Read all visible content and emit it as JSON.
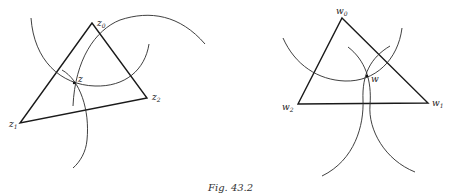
{
  "figure": {
    "caption": "Fig. 43.2",
    "left": {
      "labels": {
        "z0": {
          "base": "z",
          "sub": "0"
        },
        "z1": {
          "base": "z",
          "sub": "1"
        },
        "z2": {
          "base": "z",
          "sub": "2"
        },
        "z": {
          "base": "z"
        }
      },
      "vertices": {
        "z0": [
          92,
          23
        ],
        "z1": [
          20,
          123
        ],
        "z2": [
          147,
          98
        ]
      },
      "point": [
        74,
        83
      ]
    },
    "right": {
      "labels": {
        "w0": {
          "base": "w",
          "sub": "0"
        },
        "w1": {
          "base": "w",
          "sub": "1"
        },
        "w2": {
          "base": "w",
          "sub": "2"
        },
        "w": {
          "base": "w"
        }
      },
      "vertices": {
        "w0": [
          342,
          18
        ],
        "w1": [
          428,
          103
        ],
        "w2": [
          298,
          104
        ]
      },
      "point": [
        367,
        76
      ]
    }
  }
}
